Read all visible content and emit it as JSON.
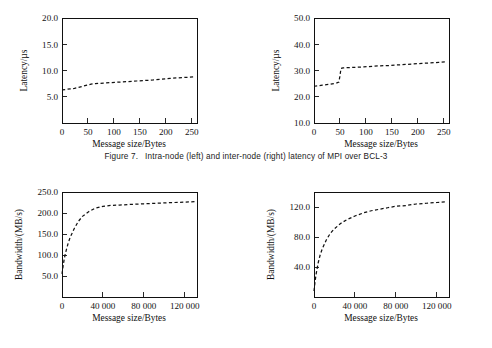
{
  "caption": {
    "label": "Figure 7.",
    "text": "Intra-node (left) and inter-node (right) latency of MPI over BCL-3"
  },
  "chart_data": [
    {
      "id": "intra-node-latency",
      "type": "line",
      "title": "",
      "xlabel": "Message size/Bytes",
      "ylabel": "Latency/µs",
      "xlim": [
        0,
        260
      ],
      "ylim": [
        0,
        20
      ],
      "xticks": [
        0,
        50,
        100,
        150,
        200,
        250
      ],
      "xtick_labels": [
        "0",
        "50",
        "100",
        "150",
        "200",
        "250"
      ],
      "yticks": [
        5,
        10,
        15,
        20
      ],
      "ytick_labels": [
        "5.0",
        "10.0",
        "15.0",
        "20.0"
      ],
      "grid": false,
      "legend": "none",
      "linestyle": "dashed",
      "x": [
        0,
        8,
        16,
        24,
        32,
        40,
        48,
        56,
        64,
        80,
        96,
        112,
        128,
        144,
        160,
        176,
        192,
        208,
        224,
        240,
        256
      ],
      "y": [
        6.3,
        6.4,
        6.5,
        6.6,
        6.8,
        7.0,
        7.2,
        7.4,
        7.5,
        7.6,
        7.7,
        7.8,
        7.9,
        8.0,
        8.1,
        8.2,
        8.35,
        8.5,
        8.6,
        8.7,
        8.8
      ]
    },
    {
      "id": "inter-node-latency",
      "type": "line",
      "title": "",
      "xlabel": "Message size/Bytes",
      "ylabel": "Latency/µs",
      "xlim": [
        0,
        260
      ],
      "ylim": [
        10,
        50
      ],
      "xticks": [
        0,
        50,
        100,
        150,
        200,
        250
      ],
      "xtick_labels": [
        "0",
        "50",
        "100",
        "150",
        "200",
        "250"
      ],
      "yticks": [
        10,
        20,
        30,
        40,
        50
      ],
      "ytick_labels": [
        "10.0",
        "20.0",
        "30.0",
        "40.0",
        "50.0"
      ],
      "grid": false,
      "legend": "none",
      "linestyle": "dashed",
      "x": [
        0,
        8,
        16,
        24,
        32,
        40,
        44,
        48,
        50,
        52,
        56,
        64,
        80,
        96,
        112,
        128,
        144,
        160,
        176,
        192,
        208,
        224,
        240,
        256
      ],
      "y": [
        24.0,
        24.2,
        24.4,
        24.6,
        24.8,
        25.1,
        25.3,
        25.6,
        28.0,
        30.8,
        31.0,
        31.1,
        31.2,
        31.4,
        31.6,
        31.8,
        31.9,
        32.1,
        32.3,
        32.5,
        32.7,
        32.9,
        33.1,
        33.3
      ]
    },
    {
      "id": "intra-node-bandwidth",
      "type": "line",
      "title": "",
      "xlabel": "Message size/Bytes",
      "ylabel": "Bandwidth/(MB/s)",
      "xlim": [
        0,
        132000
      ],
      "ylim": [
        0,
        250
      ],
      "xticks": [
        0,
        40000,
        80000,
        120000
      ],
      "xtick_labels": [
        "0",
        "40 000",
        "80 000",
        "120 000"
      ],
      "yticks": [
        50,
        100,
        150,
        200,
        250
      ],
      "ytick_labels": [
        "50.0",
        "100.0",
        "150.0",
        "200.0",
        "250.0"
      ],
      "grid": false,
      "legend": "none",
      "linestyle": "dashed",
      "x": [
        0,
        1000,
        2000,
        3000,
        4000,
        6000,
        8000,
        12000,
        16000,
        20000,
        26000,
        32000,
        40000,
        48000,
        56000,
        64000,
        72000,
        80000,
        90000,
        100000,
        110000,
        120000,
        130000
      ],
      "y": [
        55,
        72,
        88,
        100,
        110,
        128,
        142,
        163,
        180,
        192,
        203,
        211,
        216,
        218,
        219,
        220,
        221,
        222,
        223,
        224,
        225,
        226,
        227
      ]
    },
    {
      "id": "inter-node-bandwidth",
      "type": "line",
      "title": "",
      "xlabel": "Message size/Bytes",
      "ylabel": "Bandwidth/(MB/s)",
      "xlim": [
        0,
        132000
      ],
      "ylim": [
        0,
        140
      ],
      "xticks": [
        0,
        40000,
        80000,
        120000
      ],
      "xtick_labels": [
        "0",
        "40 000",
        "80 000",
        "120 000"
      ],
      "yticks": [
        40,
        80,
        120
      ],
      "ytick_labels": [
        "40.0",
        "80.0",
        "120.0"
      ],
      "grid": false,
      "legend": "none",
      "linestyle": "dashed",
      "x": [
        0,
        1000,
        2000,
        4000,
        6000,
        8000,
        12000,
        16000,
        20000,
        26000,
        32000,
        40000,
        48000,
        56000,
        64000,
        72000,
        80000,
        90000,
        100000,
        110000,
        120000,
        130000
      ],
      "y": [
        8,
        20,
        30,
        45,
        56,
        64,
        76,
        85,
        91,
        98,
        103,
        108,
        112,
        115,
        117,
        119,
        121,
        122,
        124,
        125,
        126,
        127
      ]
    }
  ]
}
